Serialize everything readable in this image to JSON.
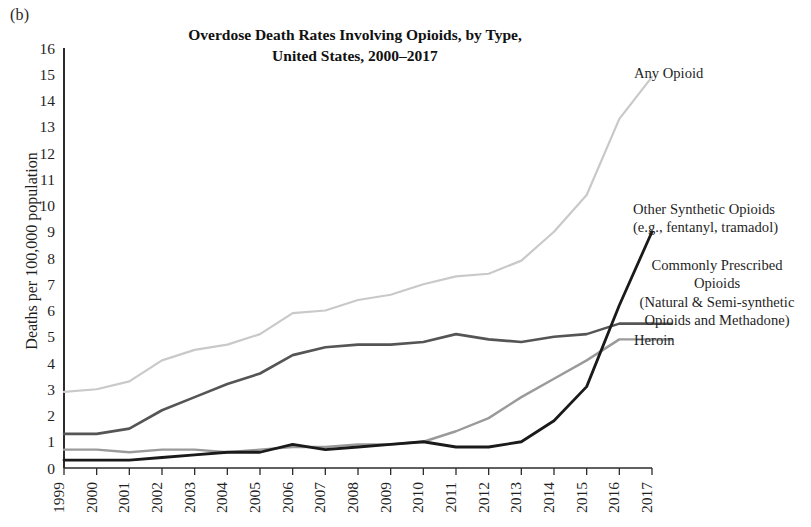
{
  "panel_label": "(b)",
  "title": {
    "line1": "Overdose Death Rates Involving Opioids, by Type,",
    "line2": "United States, 2000–2017"
  },
  "axes": {
    "ylabel": "Deaths per 100,000 population",
    "yticks": [
      "0",
      "1",
      "2",
      "3",
      "4",
      "5",
      "6",
      "7",
      "8",
      "9",
      "10",
      "11",
      "12",
      "13",
      "14",
      "15",
      "16"
    ],
    "xticks": [
      "1999",
      "2000",
      "2001",
      "2002",
      "2003",
      "2004",
      "2005",
      "2006",
      "2007",
      "2008",
      "2009",
      "2010",
      "2011",
      "2012",
      "2013",
      "2014",
      "2015",
      "2016",
      "2017"
    ]
  },
  "legend": {
    "any_opioid": "Any Opioid",
    "other_synthetic": "Other Synthetic Opioids\n(e.g., fentanyl, tramadol)",
    "commonly_prescribed": "Commonly Prescribed\nOpioids\n(Natural & Semi-synthetic\nOpioids and Methadone)",
    "heroin": "Heroin"
  },
  "colors": {
    "any_opioid": "#c9c9c9",
    "other_synthetic": "#1a1a1a",
    "commonly_prescribed": "#555555",
    "heroin": "#9a9a9a",
    "axis": "#2b2b2b"
  },
  "chart_data": {
    "type": "line",
    "title": "Overdose Death Rates Involving Opioids, by Type, United States, 2000–2017",
    "xlabel": "",
    "ylabel": "Deaths per 100,000 population",
    "xlim": [
      1999,
      2017
    ],
    "ylim": [
      0,
      16
    ],
    "grid": false,
    "legend_position": "right-inline-labels",
    "x": [
      1999,
      2000,
      2001,
      2002,
      2003,
      2004,
      2005,
      2006,
      2007,
      2008,
      2009,
      2010,
      2011,
      2012,
      2013,
      2014,
      2015,
      2016,
      2017
    ],
    "series": [
      {
        "name": "Any Opioid",
        "color": "#c9c9c9",
        "values": [
          2.9,
          3.0,
          3.3,
          4.1,
          4.5,
          4.7,
          5.1,
          5.9,
          6.0,
          6.4,
          6.6,
          7.0,
          7.3,
          7.4,
          7.9,
          9.0,
          10.4,
          13.3,
          14.9
        ]
      },
      {
        "name": "Commonly Prescribed Opioids (Natural & Semi-synthetic Opioids and Methadone)",
        "color": "#555555",
        "values": [
          1.3,
          1.3,
          1.5,
          2.2,
          2.7,
          3.2,
          3.6,
          4.3,
          4.6,
          4.7,
          4.7,
          4.8,
          5.1,
          4.9,
          4.8,
          5.0,
          5.1,
          5.5,
          5.5
        ]
      },
      {
        "name": "Heroin",
        "color": "#9a9a9a",
        "values": [
          0.7,
          0.7,
          0.6,
          0.7,
          0.7,
          0.6,
          0.7,
          0.8,
          0.8,
          0.9,
          0.9,
          1.0,
          1.4,
          1.9,
          2.7,
          3.4,
          4.1,
          4.9,
          4.9
        ]
      },
      {
        "name": "Other Synthetic Opioids (e.g., fentanyl, tramadol)",
        "color": "#1a1a1a",
        "values": [
          0.3,
          0.3,
          0.3,
          0.4,
          0.5,
          0.6,
          0.6,
          0.9,
          0.7,
          0.8,
          0.9,
          1.0,
          0.8,
          0.8,
          1.0,
          1.8,
          3.1,
          6.2,
          9.0
        ]
      }
    ]
  }
}
